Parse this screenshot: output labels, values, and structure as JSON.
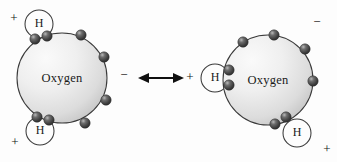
{
  "figure": {
    "background_color": "#fdfdfd",
    "width": 337,
    "height": 162,
    "oxygen_fill_light": "#f2f2f2",
    "oxygen_fill_dark": "#c9c9c9",
    "outline_color": "#3a3a3a",
    "electron_color": "#4a4a4a",
    "electron_highlight": "#d8d8d8",
    "text_color": "#1a1a1a"
  },
  "relation": {
    "arrow_symbol": "double-headed-arrow",
    "arrow_label": "↔",
    "meaning": "resonance / equivalent orientation"
  },
  "molecules": [
    {
      "id": "left",
      "nucleus_label": "Oxygen",
      "nucleus": {
        "cx": 62,
        "cy": 78,
        "r": 45
      },
      "charges": [
        {
          "label": "+",
          "x": 14,
          "y": 19,
          "name": "partial-positive-top-left"
        },
        {
          "label": "+",
          "x": 15,
          "y": 143,
          "name": "partial-positive-bottom-left"
        },
        {
          "label": "−",
          "x": 124,
          "y": 76,
          "name": "partial-negative-right"
        }
      ],
      "hydrogens": [
        {
          "label": "H",
          "cx": 39,
          "cy": 24,
          "r": 14,
          "name": "hydrogen-top-left"
        },
        {
          "label": "H",
          "cx": 40,
          "cy": 131,
          "r": 14,
          "name": "hydrogen-bottom-left"
        }
      ],
      "bond_electrons": [
        {
          "cx": 35,
          "cy": 39,
          "r": 5.2
        },
        {
          "cx": 47,
          "cy": 36,
          "r": 5.2
        },
        {
          "cx": 37,
          "cy": 117,
          "r": 5.2
        },
        {
          "cx": 49,
          "cy": 120,
          "r": 5.2
        }
      ],
      "lone_electrons": [
        {
          "cx": 81,
          "cy": 35,
          "r": 5.2
        },
        {
          "cx": 104,
          "cy": 57,
          "r": 5.2
        },
        {
          "cx": 106,
          "cy": 100,
          "r": 5.2
        },
        {
          "cx": 85,
          "cy": 123,
          "r": 5.2
        }
      ]
    },
    {
      "id": "right",
      "nucleus_label": "Oxygen",
      "nucleus": {
        "cx": 268,
        "cy": 80,
        "r": 45
      },
      "charges": [
        {
          "label": "+",
          "x": 190,
          "y": 78,
          "name": "partial-positive-left"
        },
        {
          "label": "+",
          "x": 327,
          "y": 150,
          "name": "partial-positive-bottom-right"
        },
        {
          "label": "−",
          "x": 317,
          "y": 23,
          "name": "partial-negative-top-right"
        }
      ],
      "hydrogens": [
        {
          "label": "H",
          "cx": 215,
          "cy": 78,
          "r": 14,
          "name": "hydrogen-left"
        },
        {
          "label": "H",
          "cx": 297,
          "cy": 133,
          "r": 14,
          "name": "hydrogen-bottom-right"
        }
      ],
      "bond_electrons": [
        {
          "cx": 229,
          "cy": 70,
          "r": 5.2
        },
        {
          "cx": 229,
          "cy": 85,
          "r": 5.2
        },
        {
          "cx": 286,
          "cy": 117,
          "r": 5.2
        },
        {
          "cx": 275,
          "cy": 124,
          "r": 5.2
        }
      ],
      "lone_electrons": [
        {
          "cx": 243,
          "cy": 42,
          "r": 5.2
        },
        {
          "cx": 274,
          "cy": 35,
          "r": 5.2
        },
        {
          "cx": 305,
          "cy": 49,
          "r": 5.2
        },
        {
          "cx": 313,
          "cy": 81,
          "r": 5.2
        }
      ]
    }
  ]
}
